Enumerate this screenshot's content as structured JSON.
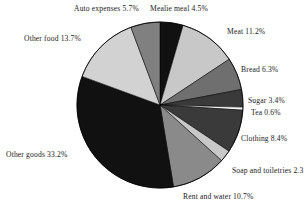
{
  "chart_data": {
    "type": "pie",
    "title": "",
    "subtitle": "",
    "xlabel": "",
    "ylabel": "",
    "legend_position": "none",
    "grid": false,
    "labels_show_percent": true,
    "start_angle_deg": 0,
    "direction": "clockwise",
    "categories": [
      "Mealie meal",
      "Meat",
      "Bread",
      "Sugar",
      "Tea",
      "Clothing",
      "Soap and toiletries",
      "Rent and water",
      "Other goods",
      "Other food",
      "Auto expenses"
    ],
    "values": [
      4.5,
      11.2,
      6.3,
      3.4,
      0.6,
      8.4,
      2.3,
      10.7,
      33.2,
      13.7,
      5.7
    ],
    "colors": [
      "#111111",
      "#c8c8c8",
      "#6f6f6f",
      "#3a3a3a",
      "#f2f2f2",
      "#3a3a3a",
      "#c8c8c8",
      "#8a8a8a",
      "#111111",
      "#d2d2d2",
      "#808080"
    ],
    "slices": [
      {
        "label": "Mealie meal",
        "value": 4.5,
        "text": "Mealie meal 4.5%",
        "color": "#111111"
      },
      {
        "label": "Meat",
        "value": 11.2,
        "text": "Meat 11.2%",
        "color": "#c8c8c8"
      },
      {
        "label": "Bread",
        "value": 6.3,
        "text": "Bread 6.3%",
        "color": "#6f6f6f"
      },
      {
        "label": "Sugar",
        "value": 3.4,
        "text": "Sugar 3.4%",
        "color": "#3a3a3a"
      },
      {
        "label": "Tea",
        "value": 0.6,
        "text": "Tea 0.6%",
        "color": "#f2f2f2"
      },
      {
        "label": "Clothing",
        "value": 8.4,
        "text": "Clothing 8.4%",
        "color": "#3a3a3a"
      },
      {
        "label": "Soap and toiletries",
        "value": 2.3,
        "text": "Soap and toiletries 2.3",
        "color": "#c8c8c8"
      },
      {
        "label": "Rent and water",
        "value": 10.7,
        "text": "Rent and water 10.7%",
        "color": "#8a8a8a"
      },
      {
        "label": "Other goods",
        "value": 33.2,
        "text": "Other goods 33.2%",
        "color": "#111111"
      },
      {
        "label": "Other food",
        "value": 13.7,
        "text": "Other food 13.7%",
        "color": "#d2d2d2"
      },
      {
        "label": "Auto expenses",
        "value": 5.7,
        "text": "Auto expenses 5.7%",
        "color": "#808080"
      }
    ],
    "geometry": {
      "center_x": 160,
      "center_y": 105,
      "radius": 83,
      "outline_color": "#000000"
    }
  }
}
